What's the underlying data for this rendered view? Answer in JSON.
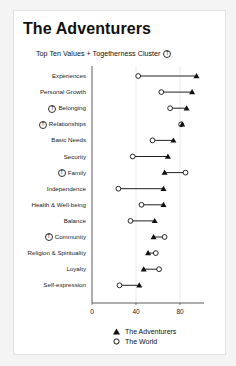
{
  "header": {
    "title": "The Adventurers",
    "subtitle": "Top Ten Values + Togetherness Cluster",
    "togetherness_marker": "T"
  },
  "legend": [
    {
      "symbol": "filled-triangle",
      "label": "The Adventurers"
    },
    {
      "symbol": "open-circle",
      "label": "The World"
    }
  ],
  "colors": {
    "marker": "#111111",
    "line": "#222222",
    "grid": "#dddddd",
    "axis": "#333333"
  },
  "chart_data": {
    "type": "dumbbell",
    "title": "The Adventurers",
    "subtitle": "Top Ten Values + Togetherness Cluster",
    "xlabel": "",
    "ylabel": "",
    "xlim": [
      0,
      100
    ],
    "xticks": [
      0,
      40,
      80
    ],
    "grid": true,
    "legend_position": "bottom",
    "categories": [
      "Experiences",
      "Personal Growth",
      "Belonging",
      "Relationships",
      "Basic Needs",
      "Security",
      "Family",
      "Independence",
      "Health & Well-being",
      "Balance",
      "Community",
      "Religion & Spirituality",
      "Loyalty",
      "Self-expression"
    ],
    "togetherness": [
      false,
      false,
      true,
      true,
      false,
      false,
      true,
      false,
      false,
      false,
      true,
      false,
      false,
      false
    ],
    "series": [
      {
        "name": "The Adventurers",
        "marker": "triangle",
        "values": [
          95,
          91,
          86,
          82,
          74,
          69,
          66,
          65,
          65,
          57,
          56,
          51,
          47,
          43
        ]
      },
      {
        "name": "The World",
        "marker": "circle",
        "values": [
          42,
          63,
          71,
          81,
          55,
          37,
          85,
          24,
          45,
          35,
          66,
          58,
          61,
          25
        ]
      }
    ]
  }
}
